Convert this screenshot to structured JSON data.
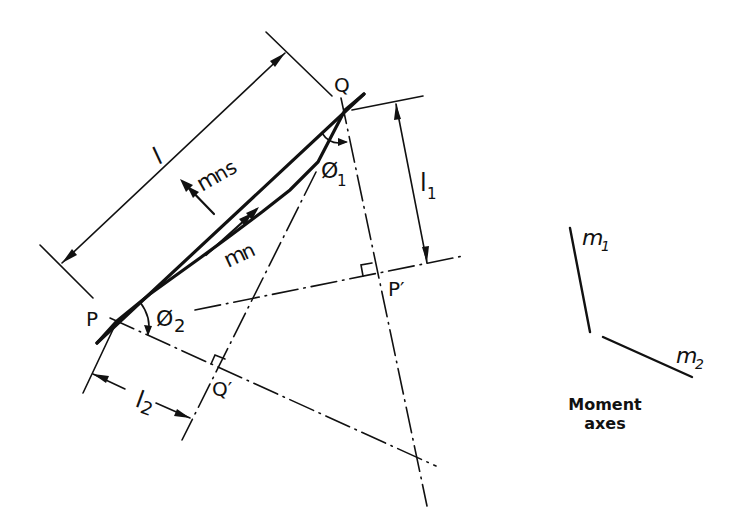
{
  "figure": {
    "labels": {
      "point_P": "P",
      "point_Q": "Q",
      "point_P_prime": "P′",
      "point_Q_prime": "Q′",
      "length_l": "l",
      "length_l1": "l",
      "length_l1_sub": "1",
      "length_l2": "l",
      "length_l2_sub": "2",
      "angle_phi1": "Ø",
      "angle_phi1_sub": "1",
      "angle_phi2": "Ø",
      "angle_phi2_sub": "2",
      "moment_mns": "m",
      "moment_mns_sub": "ns",
      "moment_mn": "m",
      "moment_mn_sub": "n"
    },
    "moment_axes": {
      "m1": "m",
      "m1_sub": "1",
      "m2": "m",
      "m2_sub": "2",
      "caption_line1": "Moment",
      "caption_line2": "axes"
    }
  }
}
